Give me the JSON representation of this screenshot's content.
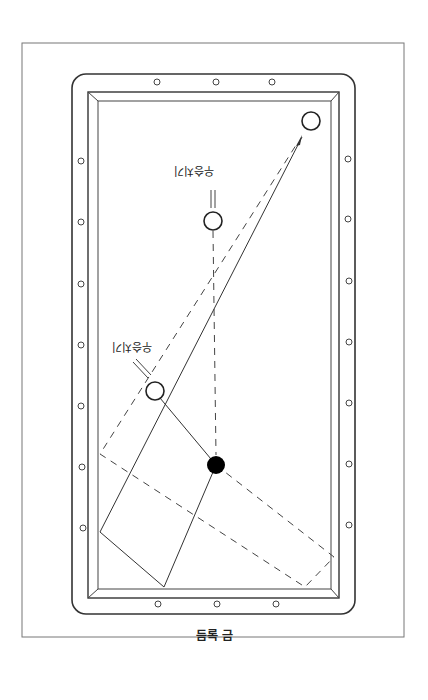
{
  "figure": {
    "caption": "듬록 금",
    "ball_labels": [
      {
        "text": "우승치기",
        "x": 174,
        "y": 164
      },
      {
        "text": "우승치기",
        "x": 112,
        "y": 340
      }
    ]
  },
  "colors": {
    "line": "#333333",
    "frame": "#555555",
    "background": "#ffffff",
    "cue_ball": "#000000"
  }
}
